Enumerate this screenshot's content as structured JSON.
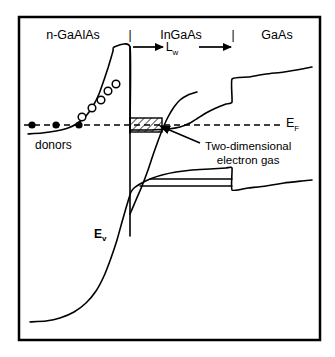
{
  "figure": {
    "type": "band-diagram",
    "frame": {
      "x": 19,
      "y": 17,
      "width": 301,
      "height": 323,
      "stroke": "#000000",
      "stroke_width": 2.5,
      "fill": "#ffffff"
    },
    "background_color": "#ffffff",
    "ink_color": "#000000"
  },
  "regions": [
    {
      "id": "left",
      "label": "n-GaAlAs",
      "x": 73,
      "y": 29
    },
    {
      "id": "middle",
      "label": "InGaAs",
      "x": 181,
      "y": 29
    },
    {
      "id": "right",
      "label": "GaAs",
      "x": 277,
      "y": 29
    }
  ],
  "region_dividers": [
    {
      "id": "divider-left",
      "label": "|",
      "x": 130,
      "y": 29
    },
    {
      "id": "divider-right",
      "label": "|",
      "x": 233,
      "y": 29
    }
  ],
  "well_width": {
    "label": "L",
    "subscript": "w",
    "x": 172,
    "y": 41,
    "arrow_left_x": 133,
    "arrow_right_x": 231,
    "arrow_y": 47
  },
  "annotations": {
    "fermi_level": {
      "label": "E",
      "subscript": "F",
      "x": 286,
      "y": 117
    },
    "valence_band": {
      "label": "E",
      "subscript": "v",
      "x": 94,
      "y": 228
    },
    "donors": {
      "label": "donors",
      "x": 35,
      "y": 139
    },
    "two_deg": {
      "line1": "Two-dimensional",
      "line2": "electron gas",
      "x": 205,
      "y": 140
    }
  },
  "chart_data": {
    "type": "line",
    "title": "",
    "xlabel": "",
    "ylabel": "",
    "curves": [
      {
        "name": "conduction-band",
        "stroke_width": 1.6,
        "points": "28,134 42,133 56,131 68,128 78,123 86,116 93,106 99,94 104,80 108,68 111,58 113,51 114,47 130,47 130,130 131,130 150,130 168,129 180,127 190,123 198,118 206,113 216,108 226,104 232,102 232,79 248,77 266,74 284,72 302,69 312,67"
      },
      {
        "name": "conduction-band-well-wall",
        "stroke_width": 1.6,
        "points": "130,47 130,236"
      },
      {
        "name": "well-electron-curve",
        "stroke_width": 1.6,
        "points": "130,214 136,200 142,186 148,170 153,155 158,141 163,128 168,117 174,107 180,100 188,95 197,92"
      },
      {
        "name": "valence-band",
        "stroke_width": 1.6,
        "points": "30,322 46,321 60,318 74,312 86,303 96,291 104,276 111,258 117,240 122,222 126,208 129,198 131,192 134,188 140,184 150,179 162,175 176,172 192,170 210,169 226,168 232,168 232,190 248,188 266,186 284,183 302,181 312,180"
      },
      {
        "name": "valence-subband-1",
        "stroke_width": 1.4,
        "points": "150,179 232,179"
      },
      {
        "name": "valence-subband-2",
        "stroke_width": 1.4,
        "points": "140,186 232,186"
      }
    ],
    "fermi_line": {
      "y": 125,
      "x_start": 24,
      "x_end": 281,
      "dash": "6,4",
      "stroke_width": 1.5
    },
    "quantum_well_hatch": {
      "x": 130,
      "y": 118,
      "width": 32,
      "height": 14,
      "hatch_angle": 45
    },
    "donor_filled_circles": [
      {
        "x": 32,
        "y": 125,
        "r": 3.6
      },
      {
        "x": 56,
        "y": 125,
        "r": 3.6
      },
      {
        "x": 79,
        "y": 125,
        "r": 3.6
      }
    ],
    "electron_open_circles": [
      {
        "x": 82,
        "y": 117,
        "r": 3.8
      },
      {
        "x": 92,
        "y": 108,
        "r": 3.8
      },
      {
        "x": 101,
        "y": 100,
        "r": 3.8
      },
      {
        "x": 108,
        "y": 91,
        "r": 3.8
      },
      {
        "x": 116,
        "y": 84,
        "r": 3.8
      }
    ],
    "pointer_arrow": {
      "from_x": 200,
      "from_y": 143,
      "to_x": 160,
      "to_y": 126
    },
    "axis_ranges": {
      "x": [
        19,
        320
      ],
      "y": [
        17,
        340
      ]
    },
    "grid": false,
    "legend": "none"
  }
}
